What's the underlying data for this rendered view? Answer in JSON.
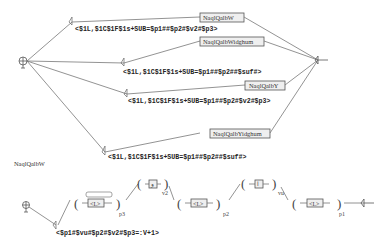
{
  "top_graph": {
    "initial_state": "initial-state",
    "final_state": "final-state",
    "paths": [
      {
        "subgraph": "NaqlQalbW",
        "output": "<$1L,$1C$1F$1s+SUB=$p1##$p2#$v2#$p3>"
      },
      {
        "subgraph": "NaqlQalbWidghum",
        "output": "<$1L,$1C$1F$1s+SUB=$p1##$p2##$suf#>"
      },
      {
        "subgraph": "NaqlQalbY",
        "output": "<$1L,$1C$1F$1s+SUB=$p1##$p2#$v2#$p3>"
      },
      {
        "subgraph": "NaqlQalbYidghum",
        "output": "<$1L,$1C$1F$1s+SUB=$p1##$p2##$suf#>"
      }
    ]
  },
  "sub_graph": {
    "title": "NaqlQalbW",
    "output": "<$p1#$vu#$p2#$v2#$p3=:V+1>",
    "groups": [
      {
        "box": "<L>",
        "var": "p3"
      },
      {
        "box": "و",
        "var": "v2"
      },
      {
        "box": "<L>",
        "var": "p2"
      },
      {
        "box": "ا",
        "var": "vu"
      },
      {
        "box": "<L>",
        "var": "p1"
      }
    ]
  }
}
